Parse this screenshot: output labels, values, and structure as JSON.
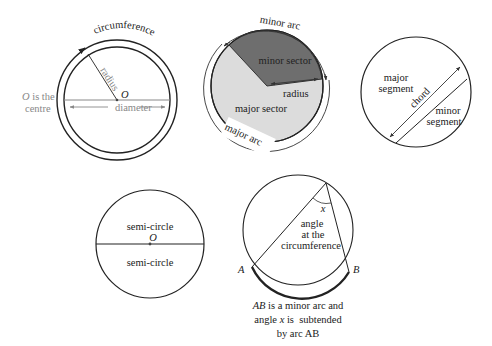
{
  "diagram": {
    "circle_parts": {
      "circumference_label": "circumference",
      "radius_label": "radius",
      "centre_letter": "O",
      "diameter_label": "diameter",
      "centre_note_letter": "O",
      "centre_note_rest": " is the",
      "centre_note_line2": "centre"
    },
    "sectors": {
      "minor_arc_label": "minor arc",
      "minor_sector_label": "minor sector",
      "radius_label": "radius",
      "major_sector_label": "major sector",
      "major_arc_label": "major arc",
      "colors": {
        "minor_sector": "#6e6e6e",
        "major_sector": "#dcdcdc"
      }
    },
    "segments": {
      "major_segment_line1": "major",
      "major_segment_line2": "segment",
      "chord_label": "chord",
      "minor_segment_line1": "minor",
      "minor_segment_line2": "segment"
    },
    "semicircle": {
      "upper_label": "semi-circle",
      "centre_letter": "O",
      "lower_label": "semi-circle"
    },
    "angle": {
      "angle_letter": "x",
      "label_line1": "angle",
      "label_line2": "at the",
      "label_line3": "circumference",
      "point_a": "A",
      "point_b": "B",
      "caption_line1_italic": "AB",
      "caption_line1_rest": " is a minor arc and",
      "caption_line2_a": "angle ",
      "caption_line2_italic": "x",
      "caption_line2_b": " is  subtended",
      "caption_line3": "by arc AB"
    }
  }
}
